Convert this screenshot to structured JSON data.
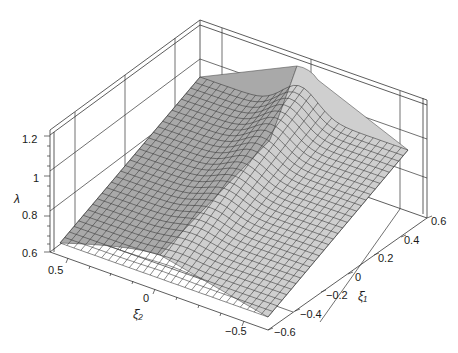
{
  "chart_data": {
    "type": "surface3d",
    "title": "",
    "zlabel": "λ",
    "xlabel": "ξ̄₂",
    "ylabel": "ξ̄₁",
    "x_axis": {
      "label": "ξ̄₂",
      "ticks": [
        "0.5",
        "0",
        "−0.5"
      ],
      "range": [
        -0.6,
        0.6
      ]
    },
    "y_axis": {
      "label": "ξ̄₁",
      "ticks": [
        "0.6",
        "0.4",
        "0.2",
        "0",
        "−0.2",
        "−0.4",
        "−0.6"
      ],
      "range": [
        -0.6,
        0.6
      ]
    },
    "z_axis": {
      "label": "λ",
      "ticks": [
        "1.2",
        "1",
        "0.8",
        "0.6"
      ],
      "range": [
        0.6,
        1.2
      ]
    },
    "box": true,
    "grid": true,
    "surface": {
      "mesh_lines": 30,
      "color": "#c8c8c8",
      "mesh_color": "#3a3a3a",
      "description": "Ridge along ξ̄₁ ≈ 0 rising toward negative ξ̄₂ side; λ ranges ~0.65 at the ξ̄₂=0.5 edge up to ~1.15 at the back-ridge peak, with a plateau ≈1.1 on back edge and sloping flank down to ~0.95 on the right edge."
    },
    "sample_values": [
      {
        "xi2": 0.6,
        "xi1": -0.6,
        "lambda": 0.66
      },
      {
        "xi2": 0.6,
        "xi1": 0.0,
        "lambda": 0.64
      },
      {
        "xi2": 0.6,
        "xi1": 0.6,
        "lambda": 0.7
      },
      {
        "xi2": 0.0,
        "xi1": -0.6,
        "lambda": 0.78
      },
      {
        "xi2": 0.0,
        "xi1": 0.0,
        "lambda": 0.9
      },
      {
        "xi2": 0.0,
        "xi1": 0.6,
        "lambda": 0.86
      },
      {
        "xi2": -0.6,
        "xi1": -0.6,
        "lambda": 0.98
      },
      {
        "xi2": -0.6,
        "xi1": 0.0,
        "lambda": 1.16
      },
      {
        "xi2": -0.6,
        "xi1": 0.6,
        "lambda": 1.05
      }
    ]
  },
  "labels": {
    "z_axis_label": "λ",
    "x_axis_label": "ξ̄₂",
    "y_axis_label": "ξ̄₁",
    "z_ticks": [
      "1.2",
      "1",
      "0.8",
      "0.6"
    ],
    "x_ticks": [
      "0.5",
      "0",
      "−0.5"
    ],
    "y_ticks": [
      "0.6",
      "0.4",
      "0.2",
      "0",
      "−0.2",
      "−0.4",
      "−0.6"
    ]
  }
}
